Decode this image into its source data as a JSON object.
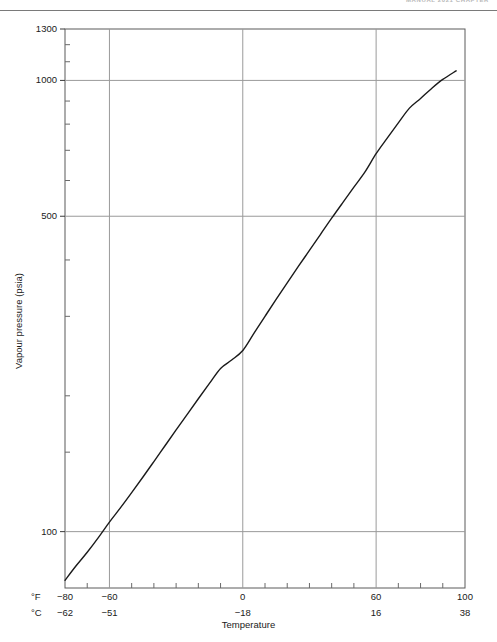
{
  "header": {
    "running_head": "MANUAL 2021  CHAPTER"
  },
  "figure": {
    "y_axis_title": "Vapour pressure (psia)",
    "x_axis_title": "Temperature",
    "unit_row_fahrenheit": "°F",
    "unit_row_celsius": "°C"
  },
  "chart_data": {
    "type": "line",
    "title": "",
    "xlabel": "Temperature",
    "ylabel": "Vapour pressure (psia)",
    "x_unit_primary": "°F",
    "x_unit_secondary": "°C",
    "yscale": "log",
    "xscale": "linear",
    "xlim": [
      -80,
      100
    ],
    "ylim": [
      75,
      1300
    ],
    "grid": true,
    "legend": "none",
    "x_major_ticks_f": [
      -80,
      -60,
      0,
      60,
      100
    ],
    "x_major_tick_labels_f": [
      "−80",
      "−60",
      "0",
      "60",
      "100"
    ],
    "x_major_tick_labels_c": [
      "−62",
      "−51",
      "−18",
      "16",
      "38"
    ],
    "x_minor_ticks_f": [
      -70,
      -50,
      -40,
      -30,
      -20,
      -10,
      10,
      20,
      30,
      40,
      50,
      70,
      80,
      90
    ],
    "y_major_ticks": [
      100,
      500,
      1000,
      1300
    ],
    "y_major_tick_labels": [
      "100",
      "500",
      "1000",
      "1300"
    ],
    "y_minor_ticks": [
      150,
      200,
      300,
      400,
      600,
      700,
      800,
      900,
      1100,
      1200
    ],
    "series": [
      {
        "name": "Vapour pressure",
        "color": "#1a1a1a",
        "x": [
          -80,
          -75,
          -70,
          -65,
          -60,
          -55,
          -50,
          -45,
          -40,
          -35,
          -30,
          -25,
          -20,
          -15,
          -10,
          -5,
          0,
          5,
          10,
          15,
          20,
          25,
          30,
          35,
          40,
          45,
          50,
          55,
          60,
          65,
          70,
          75,
          80,
          85,
          90,
          96
        ],
        "y": [
          78,
          84,
          90,
          97,
          105,
          113,
          122,
          132,
          143,
          155,
          168,
          182,
          197,
          213,
          230,
          240,
          252,
          275,
          300,
          327,
          356,
          387,
          420,
          456,
          495,
          536,
          580,
          627,
          688,
          745,
          805,
          868,
          912,
          960,
          1005,
          1050
        ]
      }
    ]
  }
}
